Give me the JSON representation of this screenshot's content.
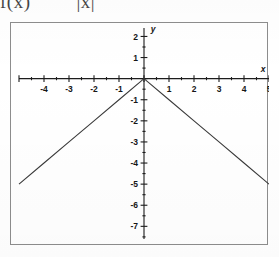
{
  "figure": {
    "caption_function": "f(x)",
    "caption_expression": "|x|",
    "caption_full": "f(x)  =  |x|"
  },
  "chart_data": {
    "type": "line",
    "title": "",
    "subtitle": "",
    "xlabel": "x",
    "ylabel": "y",
    "function": "y = -|x|",
    "xlim": [
      -5,
      5
    ],
    "ylim": [
      -7.6,
      2.4
    ],
    "grid": false,
    "legend": null,
    "axis_style": "cartesian-crosshair",
    "x_ticks_major": [
      -5,
      -4,
      -3,
      -2,
      -1,
      0,
      1,
      2,
      3,
      4,
      5
    ],
    "x_tick_labels": [
      "",
      "-4",
      "-3",
      "-2",
      "-1",
      "",
      "1",
      "2",
      "3",
      "4",
      "5"
    ],
    "x_tick_minor_step": 0.5,
    "y_ticks_major": [
      2,
      1,
      0,
      -1,
      -2,
      -3,
      -4,
      -5,
      -6,
      -7
    ],
    "y_tick_labels": [
      "2",
      "1",
      "",
      "-1",
      "-2",
      "-3",
      "-4",
      "-5",
      "-6",
      "-7"
    ],
    "y_tick_minor_step": 0.5,
    "series": [
      {
        "name": "y = -|x|",
        "x": [
          -5,
          -4,
          -3,
          -2,
          -1,
          0,
          1,
          2,
          3,
          4,
          5
        ],
        "values": [
          -5,
          -4,
          -3,
          -2,
          -1,
          0,
          -1,
          -2,
          -3,
          -4,
          -5
        ]
      }
    ],
    "annotations": []
  },
  "colors": {
    "frame": "#8d8d8d",
    "axis": "#1c1c1c",
    "curve": "#3a3a3a",
    "label": "#161616",
    "background": "#ffffff"
  }
}
